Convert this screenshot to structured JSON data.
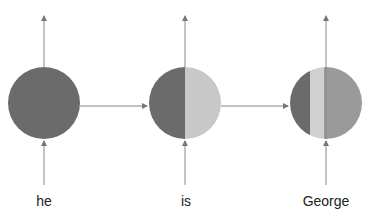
{
  "diagram": {
    "type": "rnn-hidden-state-flow",
    "nodes": [
      {
        "token": "he",
        "segments": [
          {
            "color": "#6b6b6b",
            "fraction": 1.0
          }
        ]
      },
      {
        "token": "is",
        "segments": [
          {
            "color": "#6b6b6b",
            "fraction": 0.5
          },
          {
            "color": "#c8c8c8",
            "fraction": 0.5
          }
        ]
      },
      {
        "token": "George",
        "segments": [
          {
            "color": "#6b6b6b",
            "fraction": 0.3
          },
          {
            "color": "#d0d0d0",
            "fraction": 0.2
          },
          {
            "color": "#9a9a9a",
            "fraction": 0.5
          }
        ]
      }
    ],
    "colors": {
      "dark": "#6b6b6b",
      "light": "#c8c8c8",
      "mid": "#9a9a9a",
      "line": "#888888"
    }
  },
  "labels": {
    "t1": "he",
    "t2": "is",
    "t3": "George"
  }
}
